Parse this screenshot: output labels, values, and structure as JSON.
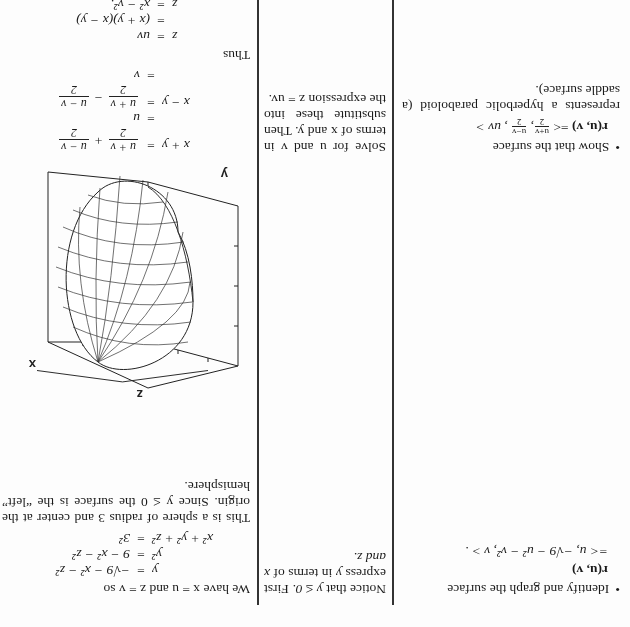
{
  "rows": [
    {
      "question": {
        "bullet": "•",
        "intro": "Identify and graph the surface",
        "r_label": "r(u, v)",
        "definition": "=< u, −√9 − u² − v², v > ."
      },
      "hint": {
        "text1": "Notice that",
        "cond": "y ≤ 0.",
        "text2": "First express",
        "var": "y",
        "text3": "in terms of",
        "vars": "x and z."
      },
      "solution": {
        "intro": "We have x = u and z = v so",
        "equations": [
          {
            "lhs": "y",
            "eq": "=",
            "rhs": "−√9 − x² − z²"
          },
          {
            "lhs": "y²",
            "eq": "=",
            "rhs": "9 − x² − z²"
          },
          {
            "lhs": "x² + y² + z²",
            "eq": "=",
            "rhs": "3²"
          }
        ],
        "conclusion": "This is a sphere of radius 3 and center at the origin. Since y ≤ 0 the surface is the “left” hemisphere.",
        "figure": {
          "axis_labels": {
            "x": "x",
            "y": "y",
            "z": "z"
          },
          "description": "3D wireframe plot of the left hemisphere inside a bounding box"
        }
      }
    },
    {
      "question": {
        "bullet": "•",
        "intro": "Show that the surface",
        "r_label": "r(u, v)",
        "definition_prefix": "=<",
        "frac1_num": "u+v",
        "frac1_den": "2",
        "frac2_num": "u−v",
        "frac2_den": "2",
        "definition_suffix": ", uv >",
        "outro": "represents a hyperbolic paraboloid (a saddle surface)."
      },
      "hint": {
        "text": "Solve for u and v in terms of x and y. Then substitute these into the expression z = uv."
      },
      "solution": {
        "equations": [
          {
            "lhs": "x + y",
            "eq": "=",
            "frac1_num": "u + v",
            "frac1_den": "2",
            "op": "+",
            "frac2_num": "u − v",
            "frac2_den": "2"
          },
          {
            "lhs": "",
            "eq": "=",
            "rhs": "u"
          },
          {
            "lhs": "x − y",
            "eq": "=",
            "frac1_num": "u + v",
            "frac1_den": "2",
            "op": "−",
            "frac2_num": "u − v",
            "frac2_den": "2"
          },
          {
            "lhs": "",
            "eq": "=",
            "rhs": "v"
          }
        ],
        "thus": "Thus",
        "equations2": [
          {
            "lhs": "z",
            "eq": "=",
            "rhs": "uv"
          },
          {
            "lhs": "",
            "eq": "=",
            "rhs": "(x + y)(x − y)"
          },
          {
            "lhs": "z",
            "eq": "=",
            "rhs": "x² − y²."
          }
        ],
        "conclusion": "This is the standard equation of the hy..."
      }
    }
  ]
}
